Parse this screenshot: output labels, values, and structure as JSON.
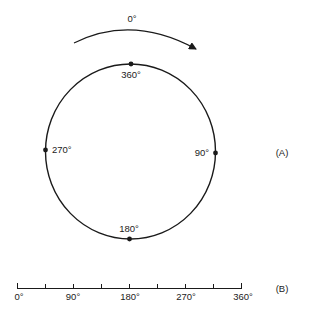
{
  "figure": {
    "colors": {
      "stroke": "#1a1a1a",
      "text": "#222222",
      "background": "#ffffff"
    },
    "panel_a": {
      "label": "(A)",
      "rotation_arrow": {
        "label": "0°",
        "direction": "clockwise"
      },
      "circle": {
        "points": [
          {
            "position": "top",
            "label": "360°"
          },
          {
            "position": "right",
            "label": "90°"
          },
          {
            "position": "bottom",
            "label": "180°"
          },
          {
            "position": "left",
            "label": "270°"
          }
        ]
      }
    },
    "panel_b": {
      "label": "(B)",
      "linear_scale": {
        "tick_count": 9,
        "tick_labels": [
          "0°",
          "90°",
          "180°",
          "270°",
          "360°"
        ]
      }
    }
  }
}
